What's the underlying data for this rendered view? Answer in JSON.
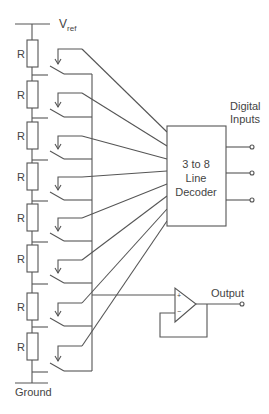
{
  "diagram": {
    "reference_label": "V",
    "reference_subscript": "ref",
    "ground_label": "Ground",
    "resistor_label": "R",
    "resistor_count": 8,
    "decoder": {
      "line1": "3 to 8",
      "line2": "Line",
      "line3": "Decoder"
    },
    "digital_inputs": {
      "line1": "Digital",
      "line2": "Inputs",
      "count": 3
    },
    "opamp": {
      "plus": "+",
      "minus": "−"
    },
    "output_label": "Output",
    "colors": {
      "line": "#555555",
      "text": "#444444",
      "background": "#ffffff"
    }
  }
}
